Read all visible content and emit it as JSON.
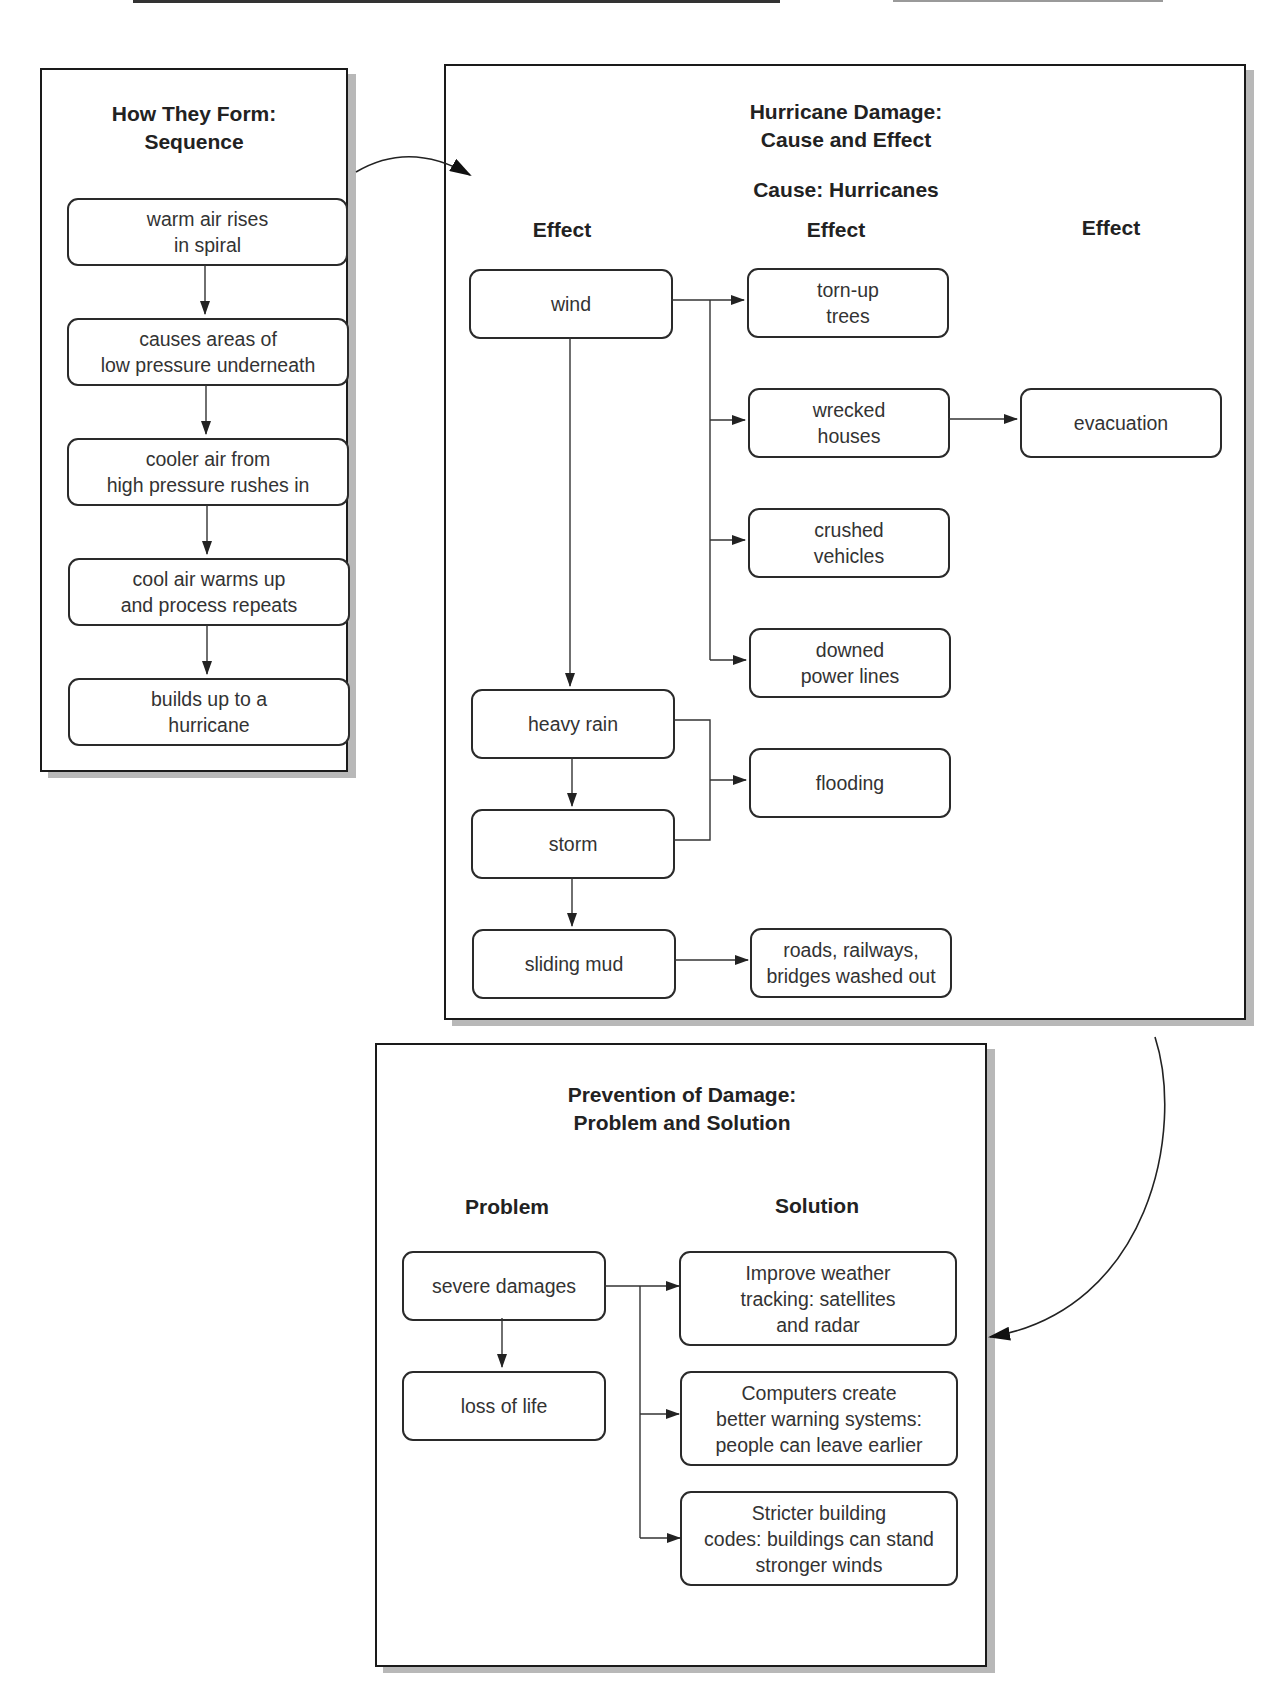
{
  "sequence_panel": {
    "title_line1": "How They Form:",
    "title_line2": "Sequence",
    "steps": [
      "warm air rises\nin spiral",
      "causes areas of\nlow pressure underneath",
      "cooler air from\nhigh pressure rushes in",
      "cool air warms up\nand process repeats",
      "builds up to a\nhurricane"
    ]
  },
  "cause_effect_panel": {
    "title_line1": "Hurricane Damage:",
    "title_line2": "Cause and Effect",
    "cause_label": "Cause: Hurricanes",
    "column_headers": [
      "Effect",
      "Effect",
      "Effect"
    ],
    "first_effects": [
      "wind",
      "heavy rain",
      "storm",
      "sliding mud"
    ],
    "second_effects": [
      "torn-up\ntrees",
      "wrecked\nhouses",
      "crushed\nvehicles",
      "downed\npower lines",
      "flooding",
      "roads, railways,\nbridges washed out"
    ],
    "third_effects": [
      "evacuation"
    ]
  },
  "problem_solution_panel": {
    "title_line1": "Prevention of Damage:",
    "title_line2": "Problem and Solution",
    "problem_header": "Problem",
    "solution_header": "Solution",
    "problems": [
      "severe damages",
      "loss of life"
    ],
    "solutions": [
      "Improve weather\ntracking: satellites\nand radar",
      "Computers create\nbetter warning systems:\npeople can leave earlier",
      "Stricter building\ncodes: buildings can stand\nstronger winds"
    ]
  }
}
